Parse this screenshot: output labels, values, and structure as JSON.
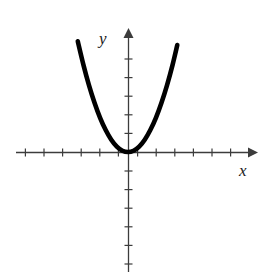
{
  "figure": {
    "background_color": "#ffffff",
    "width": 265,
    "height": 276
  },
  "axes": {
    "x_axis": {
      "label": "x",
      "label_position": {
        "x": 243,
        "y": 170
      },
      "line": {
        "x1": 16,
        "y1": 152,
        "x2": 248,
        "y2": 152
      },
      "color": "#3c3c3c",
      "stroke_width": 1.3,
      "arrow": "right",
      "tick_length": 7,
      "tick_spacing": 18.6,
      "ticks_negative": 6,
      "ticks_positive": 6
    },
    "y_axis": {
      "label": "y",
      "label_position": {
        "x": 105,
        "y": 42
      },
      "line": {
        "x1": 128,
        "y1": 30,
        "x2": 128,
        "y2": 272
      },
      "color": "#3c3c3c",
      "stroke_width": 1.3,
      "arrow": "up",
      "tick_length": 7,
      "tick_spacing": 18.6,
      "ticks_positive": 5,
      "ticks_negative": 6
    },
    "origin": {
      "x": 128,
      "y": 152
    }
  },
  "chart_data": {
    "type": "line",
    "title": "",
    "xlabel": "x",
    "ylabel": "y",
    "grid": false,
    "legend": null,
    "curve_name": "parabola",
    "equation": "y = a*x^2, a > 0",
    "vertex": {
      "x": 0,
      "y": 0
    },
    "opens": "up",
    "axis_of_symmetry": "x = 0",
    "x_intercepts": [
      0
    ],
    "y_intercept": 0,
    "xlim": [
      -6.5,
      6.5
    ],
    "ylim": [
      -6.5,
      6.0
    ],
    "stroke_color": "#000000",
    "stroke_width": 4.6,
    "x": [
      -2.7,
      -2.4,
      -2.1,
      -1.8,
      -1.5,
      -1.2,
      -0.9,
      -0.6,
      -0.3,
      0,
      0.3,
      0.6,
      0.9,
      1.2,
      1.5,
      1.8,
      2.1,
      2.4,
      2.65
    ],
    "values": [
      5.95,
      4.7,
      3.6,
      2.65,
      1.84,
      1.18,
      0.66,
      0.29,
      0.07,
      0,
      0.07,
      0.29,
      0.66,
      1.18,
      1.84,
      2.65,
      3.6,
      4.7,
      5.75
    ],
    "pixel_path": "M 78,40 C 88,72 100,114 112,140 C 118,151 122,154 128,154 C 134,154 138,151 144,140 C 156,114 168,72 177,40"
  }
}
